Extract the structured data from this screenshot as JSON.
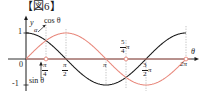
{
  "figure": {
    "title": "【図6】",
    "axis": {
      "x_axis_label": "θ",
      "y_axis_label": "y",
      "x_ticks": [
        {
          "value": "π/4",
          "num": "π",
          "den": "4",
          "suffix": "",
          "position": "below"
        },
        {
          "value": "π/2",
          "num": "π",
          "den": "2",
          "suffix": "",
          "position": "below"
        },
        {
          "value": "π",
          "num": "",
          "den": "",
          "suffix": "π",
          "position": "below"
        },
        {
          "value": "5/4π",
          "num": "5",
          "den": "4",
          "suffix": "π",
          "position": "above"
        },
        {
          "value": "3/2π",
          "num": "3",
          "den": "2",
          "suffix": "π",
          "position": "below"
        },
        {
          "value": "2π",
          "num": "",
          "den": "",
          "suffix": "2π",
          "position": "below"
        }
      ],
      "y_ticks": [
        "1",
        "-1"
      ],
      "origin_label": "0"
    },
    "curves": [
      {
        "name": "cos-curve",
        "label": "cos θ",
        "color": "#1a1a1a"
      },
      {
        "name": "sin-curve",
        "label": "sin θ",
        "color": "#e8897d"
      }
    ],
    "annotations": [
      {
        "name": "alpha-cos",
        "label": "α"
      },
      {
        "name": "alpha-sin",
        "label": "α"
      }
    ]
  },
  "chart_data": {
    "type": "line",
    "title": "【図6】",
    "xlabel": "θ",
    "ylabel": "y",
    "xlim": [
      0,
      6.2832
    ],
    "ylim": [
      -1.15,
      1.15
    ],
    "grid": false,
    "legend": "inline-annotations",
    "x_tick_values": [
      0.7854,
      1.5708,
      3.1416,
      3.927,
      4.7124,
      6.2832
    ],
    "x_tick_labels": [
      "π/4",
      "π/2",
      "π",
      "5/4π",
      "3/2π",
      "2π"
    ],
    "y_tick_values": [
      1,
      -1
    ],
    "y_tick_labels": [
      "1",
      "-1"
    ],
    "series": [
      {
        "name": "cos θ",
        "color": "#1a1a1a",
        "x": [
          0,
          0.3927,
          0.7854,
          1.1781,
          1.5708,
          1.9635,
          2.3562,
          2.7489,
          3.1416,
          3.5343,
          3.927,
          4.3197,
          4.7124,
          5.1051,
          5.4978,
          5.8905,
          6.2832
        ],
        "values": [
          1,
          0.9239,
          0.7071,
          0.3827,
          0,
          -0.3827,
          -0.7071,
          -0.9239,
          -1,
          -0.9239,
          -0.7071,
          -0.3827,
          0,
          0.3827,
          0.7071,
          0.9239,
          1
        ]
      },
      {
        "name": "sin θ",
        "color": "#e8897d",
        "x": [
          0,
          0.3927,
          0.7854,
          1.1781,
          1.5708,
          1.9635,
          2.3562,
          2.7489,
          3.1416,
          3.5343,
          3.927,
          4.3197,
          4.7124,
          5.1051,
          5.4978,
          5.8905,
          6.2832
        ],
        "values": [
          0,
          0.3827,
          0.7071,
          0.9239,
          1,
          0.9239,
          0.7071,
          0.3827,
          0,
          -0.3827,
          -0.7071,
          -0.9239,
          -1,
          -0.9239,
          -0.7071,
          -0.3827,
          0
        ]
      }
    ],
    "annotations": [
      {
        "text": "cos θ",
        "target_x": 0.35,
        "target_y": 0.94
      },
      {
        "text": "sin θ",
        "target_x": 0.7854,
        "target_y": 0.0
      },
      {
        "text": "α",
        "count": 2
      }
    ],
    "markers": [
      {
        "x": 0.7854,
        "y": 0,
        "style": "open-circle",
        "color": "#e8897d"
      },
      {
        "x": 6.2832,
        "y": 0,
        "style": "open-circle",
        "color": "#e8897d"
      },
      {
        "x": 3.927,
        "y": 0,
        "style": "open-circle",
        "color": "#e8897d"
      }
    ]
  }
}
